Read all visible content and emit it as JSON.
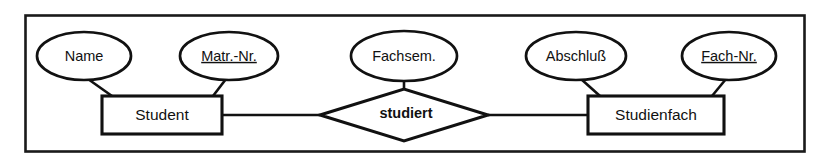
{
  "figure": {
    "kind": "entity-relationship-diagram",
    "notation": "chen",
    "frame": {
      "stroke_color": "#1a1a1a"
    },
    "ink_color": "#111111",
    "background_color": "#ffffff"
  },
  "entities": [
    {
      "id": "student",
      "label": "Student",
      "shape": "rectangle",
      "x": 102,
      "y": 96,
      "width": 120,
      "height": 38
    },
    {
      "id": "studienfach",
      "label": "Studienfach",
      "shape": "rectangle",
      "x": 588,
      "y": 96,
      "width": 136,
      "height": 38
    }
  ],
  "relationships": [
    {
      "id": "studiert",
      "label": "studiert",
      "shape": "diamond",
      "cx": 404,
      "cy": 115,
      "rx": 84,
      "ry": 26,
      "connects": [
        "student",
        "studienfach"
      ]
    }
  ],
  "attributes": [
    {
      "id": "name",
      "label": "Name",
      "shape": "ellipse",
      "is_key": false,
      "underlined": false,
      "owner": "student",
      "cx": 84,
      "cy": 56,
      "rx": 47,
      "ry": 24,
      "anchor_x": 112,
      "anchor_y": 96
    },
    {
      "id": "matr-nr",
      "label": "Matr.-Nr.",
      "shape": "ellipse",
      "is_key": true,
      "underlined": true,
      "owner": "student",
      "cx": 229,
      "cy": 56,
      "rx": 49,
      "ry": 24,
      "anchor_x": 213,
      "anchor_y": 96
    },
    {
      "id": "fachsem",
      "label": "Fachsem.",
      "shape": "ellipse",
      "is_key": false,
      "underlined": false,
      "owner": "studiert",
      "cx": 404,
      "cy": 56,
      "rx": 53,
      "ry": 25,
      "anchor_x": 404,
      "anchor_y": 89
    },
    {
      "id": "abschluss",
      "label": "Abschluß",
      "shape": "ellipse",
      "is_key": false,
      "underlined": false,
      "owner": "studienfach",
      "cx": 576,
      "cy": 56,
      "rx": 50,
      "ry": 24,
      "anchor_x": 600,
      "anchor_y": 96
    },
    {
      "id": "fach-nr",
      "label": "Fach-Nr.",
      "shape": "ellipse",
      "is_key": true,
      "underlined": true,
      "owner": "studienfach",
      "cx": 729,
      "cy": 56,
      "rx": 47,
      "ry": 24,
      "anchor_x": 712,
      "anchor_y": 96
    }
  ],
  "edges": [
    {
      "id": "student-to-studiert",
      "from": "student",
      "to": "studiert"
    },
    {
      "id": "studiert-to-studienfach",
      "from": "studiert",
      "to": "studienfach"
    },
    {
      "id": "name-to-student",
      "from": "name",
      "to": "student"
    },
    {
      "id": "matr-nr-to-student",
      "from": "matr-nr",
      "to": "student"
    },
    {
      "id": "fachsem-to-studiert",
      "from": "fachsem",
      "to": "studiert"
    },
    {
      "id": "abschluss-to-studienfach",
      "from": "abschluss",
      "to": "studienfach"
    },
    {
      "id": "fach-nr-to-studienfach",
      "from": "fach-nr",
      "to": "studienfach"
    }
  ]
}
